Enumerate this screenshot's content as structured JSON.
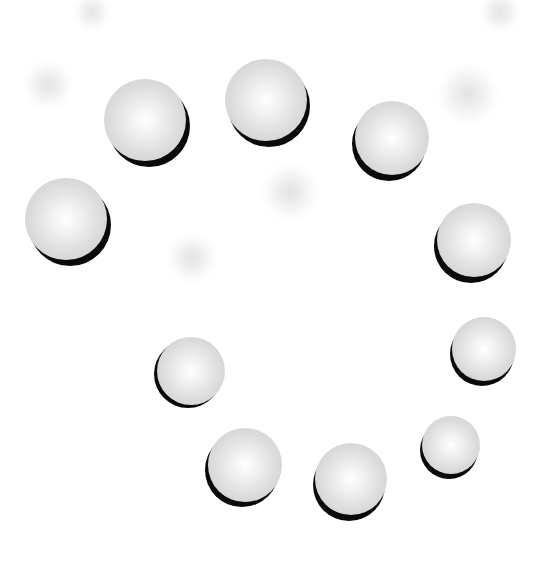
{
  "scene": {
    "background": "#ffffff",
    "sphere_color": "#e0e0e0",
    "shadow_color": "#0a0a0a",
    "spheres": [
      {
        "cx": 66,
        "cy": 219,
        "r": 41,
        "sx": 4,
        "sy": 6
      },
      {
        "cx": 145,
        "cy": 120,
        "r": 41,
        "sx": 4,
        "sy": 6
      },
      {
        "cx": 266,
        "cy": 100,
        "r": 41,
        "sx": 3,
        "sy": 6
      },
      {
        "cx": 392,
        "cy": 138,
        "r": 37,
        "sx": -3,
        "sy": 6
      },
      {
        "cx": 474,
        "cy": 240,
        "r": 37,
        "sx": -3,
        "sy": 6
      },
      {
        "cx": 484,
        "cy": 349,
        "r": 32,
        "sx": -2,
        "sy": 5
      },
      {
        "cx": 451,
        "cy": 445,
        "r": 29,
        "sx": -2,
        "sy": 5
      },
      {
        "cx": 351,
        "cy": 479,
        "r": 36,
        "sx": -2,
        "sy": 6
      },
      {
        "cx": 245,
        "cy": 465,
        "r": 37,
        "sx": -3,
        "sy": 5
      },
      {
        "cx": 191,
        "cy": 371,
        "r": 34,
        "sx": -3,
        "sy": 3
      }
    ],
    "blobs": [
      {
        "cx": 92,
        "cy": 12,
        "r": 18
      },
      {
        "cx": 48,
        "cy": 85,
        "r": 24
      },
      {
        "cx": 290,
        "cy": 192,
        "r": 28
      },
      {
        "cx": 192,
        "cy": 258,
        "r": 24
      },
      {
        "cx": 468,
        "cy": 94,
        "r": 30
      },
      {
        "cx": 500,
        "cy": 12,
        "r": 20
      }
    ]
  }
}
